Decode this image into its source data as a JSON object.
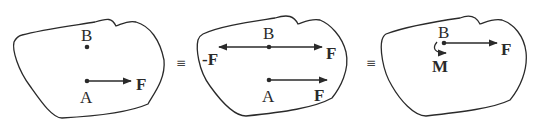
{
  "panels": [
    {
      "id": "panel-1",
      "points": [
        {
          "name": "B",
          "label": "B"
        },
        {
          "name": "A",
          "label": "A"
        }
      ],
      "forces": [
        {
          "label": "F",
          "from": "A",
          "direction": "right"
        }
      ]
    },
    {
      "id": "panel-2",
      "points": [
        {
          "name": "B",
          "label": "B"
        },
        {
          "name": "A",
          "label": "A"
        }
      ],
      "forces": [
        {
          "label": "-F",
          "at": "B",
          "direction": "left"
        },
        {
          "label": "F",
          "at": "B",
          "direction": "right"
        },
        {
          "label": "F",
          "at": "A",
          "direction": "right"
        }
      ]
    },
    {
      "id": "panel-3",
      "points": [
        {
          "name": "B",
          "label": "B"
        }
      ],
      "forces": [
        {
          "label": "F",
          "at": "B",
          "direction": "right"
        }
      ],
      "moments": [
        {
          "label": "M",
          "at": "B",
          "direction": "clockwise"
        }
      ]
    }
  ],
  "equivalence_symbols": [
    "≡",
    "≡"
  ],
  "colors": {
    "stroke": "#2a2a2a",
    "background": "#ffffff"
  }
}
